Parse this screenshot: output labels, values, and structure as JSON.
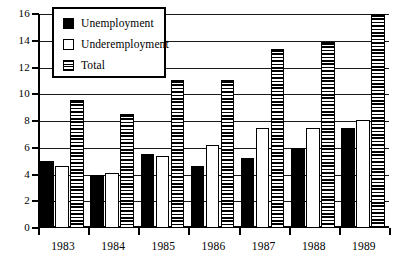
{
  "chart_data": {
    "type": "bar",
    "title": "",
    "subtitle": "",
    "xlabel": "",
    "ylabel": "",
    "categories": [
      "1983",
      "1984",
      "1985",
      "1986",
      "1987",
      "1988",
      "1989"
    ],
    "series": [
      {
        "name": "Unemployment",
        "swatch": "solid-black",
        "values": [
          5.0,
          4.0,
          5.5,
          4.6,
          5.2,
          6.0,
          7.5
        ]
      },
      {
        "name": "Underemployment",
        "swatch": "solid-white",
        "values": [
          4.6,
          4.1,
          5.4,
          6.2,
          7.5,
          7.5,
          8.1
        ]
      },
      {
        "name": "Total",
        "swatch": "horizontal-stripes",
        "values": [
          9.6,
          8.5,
          11.1,
          11.1,
          13.4,
          13.9,
          16.0
        ]
      }
    ],
    "ylim": [
      0,
      16
    ],
    "yticks": [
      0,
      2,
      4,
      6,
      8,
      10,
      12,
      14,
      16
    ],
    "ytick_labels": [
      "0",
      "2",
      "4",
      "6",
      "8",
      "10",
      "12",
      "14",
      "16"
    ],
    "grid": true,
    "grid_axis": "y",
    "legend_position": "top-left-inset",
    "legend_entries": [
      "Unemployment",
      "Underemployment",
      "Total"
    ],
    "annotations": []
  },
  "colors": {
    "axis": "#000000",
    "grid": "#1a1a1a",
    "unemployment": "#000000",
    "underemployment": "#ffffff",
    "total_stripe": "#000000",
    "background": "#ffffff"
  }
}
